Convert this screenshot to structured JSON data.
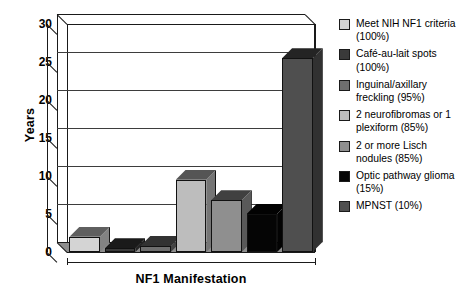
{
  "chart_data": {
    "type": "bar",
    "title": "",
    "xlabel": "NF1 Manifestation",
    "ylabel": "Years",
    "ylim": [
      0,
      30
    ],
    "ytick_labels": [
      "30",
      "25",
      "20",
      "15",
      "10",
      "5",
      "0"
    ],
    "ytick_values": [
      30,
      25,
      20,
      15,
      10,
      5,
      0
    ],
    "ytick_step": 5,
    "grid": "horizontal",
    "legend_position": "right",
    "style": "3d-bar",
    "categories": [
      "Meet NIH NF1 criteria (100%)",
      "Café-au-lait spots (100%)",
      "Inguinal/axillary freckling (95%)",
      "2 neurofibromas or 1 plexiform (85%)",
      "2 or more Lisch nodules (85%)",
      "Optic pathway glioma (15%)",
      "MPNST (10%)"
    ],
    "values": [
      2.0,
      0.5,
      0.8,
      9.5,
      6.8,
      5.0,
      25.5
    ],
    "colors": [
      "#d4d4d4",
      "#3a3a3a",
      "#6e6e6e",
      "#bdbdbd",
      "#8f8f8f",
      "#050505",
      "#4f4f4f"
    ]
  },
  "axes": {
    "y_title": "Years",
    "x_title": "NF1 Manifestation",
    "y_ticks": [
      {
        "label": "30",
        "value": 30
      },
      {
        "label": "25",
        "value": 25
      },
      {
        "label": "20",
        "value": 20
      },
      {
        "label": "15",
        "value": 15
      },
      {
        "label": "10",
        "value": 10
      },
      {
        "label": "5",
        "value": 5
      },
      {
        "label": "0",
        "value": 0
      }
    ]
  },
  "legend": {
    "entries": [
      {
        "label": "Meet NIH NF1 criteria (100%)",
        "color": "#d4d4d4"
      },
      {
        "label": "Café-au-lait spots (100%)",
        "color": "#3a3a3a"
      },
      {
        "label": "Inguinal/axillary freckling (95%)",
        "color": "#6e6e6e"
      },
      {
        "label": "2 neurofibromas or 1 plexiform (85%)",
        "color": "#bdbdbd"
      },
      {
        "label": "2 or more Lisch nodules (85%)",
        "color": "#8f8f8f"
      },
      {
        "label": "Optic pathway glioma (15%)",
        "color": "#050505"
      },
      {
        "label": "MPNST (10%)",
        "color": "#4f4f4f"
      }
    ]
  }
}
